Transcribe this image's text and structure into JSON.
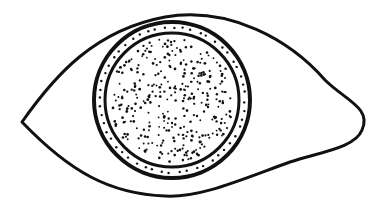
{
  "diagram": {
    "style": "line-drawing with stippled iris",
    "colors": {
      "stroke": "#111111",
      "background": "#ffffff",
      "dots": "#111111"
    },
    "parts": [
      {
        "name": "eye-outline",
        "shape": "almond"
      },
      {
        "name": "iris-outer-ring",
        "shape": "circle"
      },
      {
        "name": "iris-band",
        "shape": "dotted ring"
      },
      {
        "name": "iris-inner-ring",
        "shape": "circle"
      },
      {
        "name": "stippled-pupil-area",
        "shape": "dotted disc"
      }
    ]
  }
}
